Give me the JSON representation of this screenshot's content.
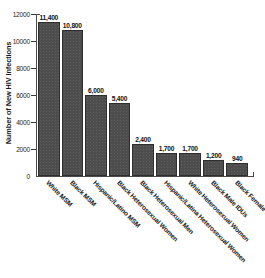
{
  "chart_data": {
    "type": "bar",
    "title": "",
    "xlabel": "",
    "ylabel": "Number of New HIV Infections",
    "ylim": [
      0,
      12000
    ],
    "yticks": [
      0,
      2000,
      4000,
      6000,
      8000,
      10000,
      12000
    ],
    "ytick_labels": [
      "0",
      "2000",
      "4000",
      "6000",
      "8000",
      "10000",
      "12000"
    ],
    "grid": false,
    "legend": "none",
    "bar_color": "#4d4d4d",
    "categories": [
      "White MSM",
      "Black MSM",
      "Hispanic/Latino MSM",
      "Black Heterosexual Women",
      "Black Heterosexual Men",
      "Hispanic/Latina Heterosexual Women",
      "White Heterosexual Women",
      "Black Male IDUs",
      "Black Female IDUs"
    ],
    "values": [
      11400,
      10800,
      6000,
      5400,
      2400,
      1700,
      1700,
      1200,
      940
    ],
    "value_labels": [
      "11,400",
      "10,800",
      "6,000",
      "5,400",
      "2,400",
      "1,700",
      "1,700",
      "1,200",
      "940"
    ]
  }
}
